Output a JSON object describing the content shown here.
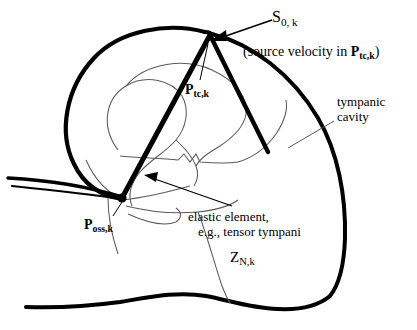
{
  "figure": {
    "type": "anatomical-diagram",
    "background_color": "#ffffff",
    "line_color": "#000000",
    "thin_line_color": "#555555"
  },
  "labels": {
    "source_symbol": "S",
    "source_subscript": "0, k",
    "source_caption_pre": "(source  velocity in ",
    "source_caption_bold": "P",
    "source_caption_sub": "tc,k",
    "source_caption_post": ")",
    "ptc_symbol": "P",
    "ptc_subscript": "tc,k",
    "poss_symbol": "P",
    "poss_subscript": "oss,k",
    "tympanic_line1": "tympanic",
    "tympanic_line2": "cavity",
    "elastic_line1": "elastic element,",
    "elastic_line2": "e.g., tensor tympani",
    "impedance_symbol": "Z",
    "impedance_subscript": "N,k"
  }
}
